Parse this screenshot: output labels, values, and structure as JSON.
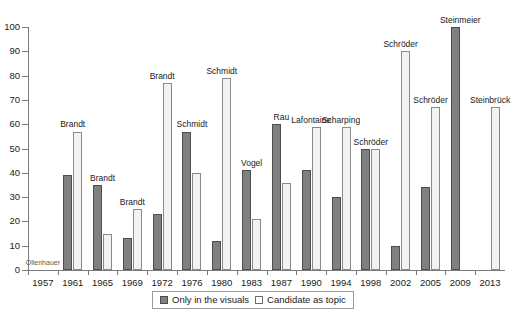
{
  "chart_data": {
    "type": "bar",
    "title": "",
    "xlabel": "",
    "ylabel": "",
    "ylim": [
      0,
      100
    ],
    "yticks": [
      0,
      10,
      20,
      30,
      40,
      50,
      60,
      70,
      80,
      90,
      100
    ],
    "grid": false,
    "legend_position": "bottom",
    "categories": [
      "1957",
      "1961",
      "1965",
      "1969",
      "1972",
      "1976",
      "1980",
      "1983",
      "1987",
      "1990",
      "1994",
      "1998",
      "2002",
      "2005",
      "2009",
      "2013"
    ],
    "series": [
      {
        "name": "Only in the visuals",
        "values": [
          null,
          39,
          35,
          13,
          23,
          57,
          12,
          41,
          60,
          41,
          30,
          50,
          10,
          34,
          100,
          null
        ]
      },
      {
        "name": "Candidate as topic",
        "values": [
          null,
          57,
          15,
          25,
          77,
          40,
          79,
          21,
          36,
          59,
          59,
          50,
          90,
          67,
          null,
          67
        ]
      }
    ],
    "annotations": [
      {
        "category": "1957",
        "label": "Ollenhauer"
      },
      {
        "category": "1961",
        "label": "Brandt"
      },
      {
        "category": "1965",
        "label": "Brandt"
      },
      {
        "category": "1969",
        "label": "Brandt"
      },
      {
        "category": "1972",
        "label": "Brandt"
      },
      {
        "category": "1976",
        "label": "Schmidt"
      },
      {
        "category": "1980",
        "label": "Schmidt"
      },
      {
        "category": "1983",
        "label": "Vogel"
      },
      {
        "category": "1987",
        "label": "Rau"
      },
      {
        "category": "1990",
        "label": "Lafontaine"
      },
      {
        "category": "1994",
        "label": "Scharping"
      },
      {
        "category": "1998",
        "label": "Schröder"
      },
      {
        "category": "2002",
        "label": "Schröder"
      },
      {
        "category": "2005",
        "label": "Schröder"
      },
      {
        "category": "2009",
        "label": "Steinmeier"
      },
      {
        "category": "2013",
        "label": "Steinbrück"
      }
    ]
  },
  "legend": {
    "items": [
      {
        "label": "Only in the visuals",
        "color": "#808080"
      },
      {
        "label": "Candidate as topic",
        "color": "#ffffff"
      }
    ]
  },
  "caption": {
    "text": ""
  }
}
